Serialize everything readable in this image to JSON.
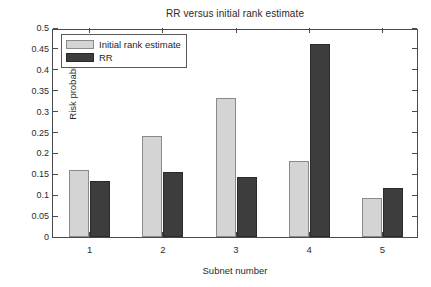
{
  "chart_data": {
    "type": "bar",
    "title": "RR versus initial rank estimate",
    "xlabel": "Subnet number",
    "ylabel": "Risk probability",
    "categories": [
      "1",
      "2",
      "3",
      "4",
      "5"
    ],
    "series": [
      {
        "name": "Initial rank estimate",
        "color": "#d4d4d4",
        "values": [
          0.16,
          0.242,
          0.332,
          0.182,
          0.094
        ]
      },
      {
        "name": "RR",
        "color": "#3d3d3d",
        "values": [
          0.135,
          0.155,
          0.144,
          0.461,
          0.117
        ]
      }
    ],
    "ylim": [
      0,
      0.5
    ],
    "yticks": [
      0,
      0.05,
      0.1,
      0.15,
      0.2,
      0.25,
      0.3,
      0.35,
      0.4,
      0.45,
      0.5
    ],
    "ytick_labels": [
      "0",
      "0.05",
      "0.1",
      "0.15",
      "0.2",
      "0.25",
      "0.3",
      "0.35",
      "0.4",
      "0.45",
      "0.5"
    ],
    "grid": false,
    "legend_position": "upper-left-inside"
  },
  "legend": {
    "entries": [
      {
        "label": "Initial rank estimate"
      },
      {
        "label": "RR"
      }
    ]
  }
}
